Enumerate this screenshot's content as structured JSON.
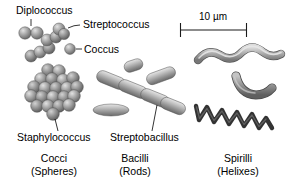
{
  "figure": {
    "background_color": "#ffffff",
    "text_color": "#000000"
  },
  "scale_bar": {
    "label": "10 µm",
    "x_start": 180,
    "x_end": 247,
    "y": 30
  },
  "callouts": {
    "diplococcus": "Diplococcus",
    "streptococcus": "Streptococcus",
    "coccus": "Coccus",
    "staphylococcus": "Staphylococcus",
    "streptobacillus": "Streptobacillus"
  },
  "groups": [
    {
      "name": "Cocci",
      "subtitle": "(Spheres)"
    },
    {
      "name": "Bacilli",
      "subtitle": "(Rods)"
    },
    {
      "name": "Spirilli",
      "subtitle": "(Helixes)"
    }
  ],
  "colors": {
    "cell_light": "#d8d8d8",
    "cell_mid": "#9a9a9a",
    "cell_dark": "#6e6e6e",
    "spiral_dark": "#3a3a3a",
    "outline": "#4a4a4a",
    "ink": "#000000"
  },
  "shapes": {
    "diplococcus_count": 2,
    "streptococcus_chain_count": 7,
    "staphylococcus_cluster_count": 21,
    "coccus_count": 1,
    "streptobacillus_chain_count": 4,
    "single_bacilli_count": 3,
    "spirilli_forms": [
      "wave",
      "comma",
      "zigzag-helix"
    ]
  }
}
